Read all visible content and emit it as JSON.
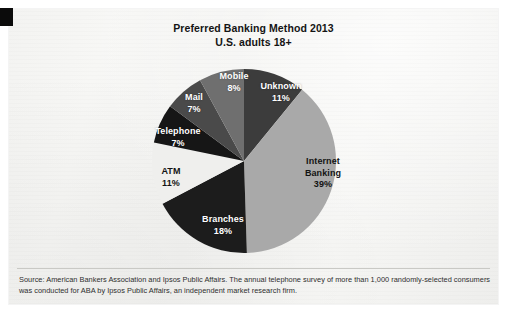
{
  "card": {
    "corner_mark_color": "#0b0b0b",
    "background_color": "#f4f4f2"
  },
  "header": {
    "title_line1": "Preferred Banking Method 2013",
    "title_line2": "U.S. adults 18+"
  },
  "source": {
    "line1": "Source: American Bankers Association and Ipsos Public Affairs. The annual telephone survey of more than 1,000 randomly-selected consumers",
    "line2": "was conducted for ABA by Ipsos Public Affairs, an independent market research firm."
  },
  "chart_data": {
    "type": "pie",
    "title": "Preferred Banking Method 2013",
    "subtitle": "U.S. adults 18+",
    "xlabel": "",
    "ylabel": "",
    "legend": "none",
    "value_unit": "percent",
    "start_angle_deg": 0,
    "direction": "clockwise",
    "categories": [
      "Unknown",
      "Internet Banking",
      "Branches",
      "ATM",
      "Telephone",
      "Mail",
      "Mobile"
    ],
    "values": [
      11,
      39,
      18,
      11,
      7,
      7,
      8
    ],
    "colors": [
      "#3c3c3c",
      "#a9a9a9",
      "#1c1c1c",
      "#efefed",
      "#161616",
      "#4a4a4a",
      "#6f6f6f"
    ],
    "slices": [
      {
        "label": "Unknown",
        "value": 11,
        "display": "11%",
        "color": "#3c3c3c",
        "label_color": "#ffffff"
      },
      {
        "label": "Internet Banking",
        "value": 39,
        "display": "39%",
        "color": "#a9a9a9",
        "label_color": "#131313"
      },
      {
        "label": "Branches",
        "value": 18,
        "display": "18%",
        "color": "#1c1c1c",
        "label_color": "#ffffff"
      },
      {
        "label": "ATM",
        "value": 11,
        "display": "11%",
        "color": "#efefed",
        "label_color": "#131313"
      },
      {
        "label": "Telephone",
        "value": 7,
        "display": "7%",
        "color": "#161616",
        "label_color": "#ffffff"
      },
      {
        "label": "Mail",
        "value": 7,
        "display": "7%",
        "color": "#4a4a4a",
        "label_color": "#ffffff"
      },
      {
        "label": "Mobile",
        "value": 8,
        "display": "8%",
        "color": "#6f6f6f",
        "label_color": "#ffffff"
      }
    ]
  },
  "labels": {
    "unknown_name": "Unknown",
    "unknown_pct": "11%",
    "internet_name_line1": "Internet",
    "internet_name_line2": "Banking",
    "internet_pct": "39%",
    "branches_name": "Branches",
    "branches_pct": "18%",
    "atm_name": "ATM",
    "atm_pct": "11%",
    "telephone_name": "Telephone",
    "telephone_pct": "7%",
    "mail_name": "Mail",
    "mail_pct": "7%",
    "mobile_name": "Mobile",
    "mobile_pct": "8%"
  }
}
